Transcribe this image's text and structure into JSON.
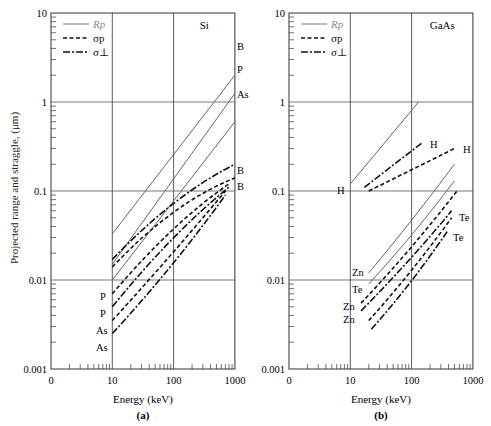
{
  "chart_data": [
    {
      "type": "line",
      "panel_label": "(a)",
      "material": "Si",
      "xlabel": "Energy (keV)",
      "ylabel": "Projected range and straggle, (μm)",
      "xscale": "log",
      "yscale": "log",
      "xticks": [
        "0",
        "10",
        "100",
        "1000"
      ],
      "yticks": [
        "10",
        "1",
        "0.1",
        "0.01",
        "0.001"
      ],
      "xlim": [
        1,
        1000
      ],
      "ylim": [
        0.001,
        10
      ],
      "grid": true,
      "legend": [
        {
          "label": "Rp",
          "style": "solid"
        },
        {
          "label": "σp",
          "style": "dashed"
        },
        {
          "label": "σ⊥",
          "style": "dashdot"
        }
      ],
      "legend_position": "upper left",
      "series": [
        {
          "name": "Rp B",
          "style": "solid",
          "label": "B",
          "x": [
            10,
            1000
          ],
          "y": [
            0.033,
            2.0
          ]
        },
        {
          "name": "Rp P",
          "style": "solid",
          "label": "P",
          "x": [
            10,
            1000
          ],
          "y": [
            0.015,
            1.25
          ]
        },
        {
          "name": "Rp As",
          "style": "solid",
          "label": "As",
          "x": [
            10,
            1000
          ],
          "y": [
            0.01,
            0.6
          ]
        },
        {
          "name": "σ⊥ B",
          "style": "dashdot",
          "label": "B",
          "x": [
            10,
            100,
            1000
          ],
          "y": [
            0.017,
            0.09,
            0.2
          ]
        },
        {
          "name": "σp B",
          "style": "dashed",
          "label": "B",
          "x": [
            10,
            100,
            1000
          ],
          "y": [
            0.014,
            0.075,
            0.14
          ]
        },
        {
          "name": "σp P",
          "style": "dashed",
          "label": "P",
          "x": [
            10,
            100,
            800
          ],
          "y": [
            0.007,
            0.045,
            0.12
          ]
        },
        {
          "name": "σ⊥ P",
          "style": "dashdot",
          "label": "P",
          "x": [
            10,
            100,
            800
          ],
          "y": [
            0.005,
            0.035,
            0.11
          ]
        },
        {
          "name": "σp As",
          "style": "dashed",
          "label": "As",
          "x": [
            10,
            100,
            700
          ],
          "y": [
            0.0035,
            0.02,
            0.1
          ]
        },
        {
          "name": "σ⊥ As",
          "style": "dashdot",
          "label": "As",
          "x": [
            10,
            100,
            700
          ],
          "y": [
            0.0025,
            0.014,
            0.09
          ]
        }
      ]
    },
    {
      "type": "line",
      "panel_label": "(b)",
      "material": "GaAs",
      "xlabel": "Energy (keV)",
      "ylabel": "",
      "xscale": "log",
      "yscale": "log",
      "xticks": [
        "0",
        "10",
        "100",
        "1000"
      ],
      "yticks": [
        "10",
        "1",
        "0.1",
        "0.01",
        "0.001"
      ],
      "xlim": [
        1,
        1000
      ],
      "ylim": [
        0.001,
        10
      ],
      "grid": true,
      "legend": [
        {
          "label": "Rp",
          "style": "solid"
        },
        {
          "label": "σp",
          "style": "dashed"
        },
        {
          "label": "σ⊥",
          "style": "dashdot"
        }
      ],
      "legend_position": "upper left",
      "series": [
        {
          "name": "Rp H",
          "style": "solid",
          "label": "H",
          "x": [
            10,
            130
          ],
          "y": [
            0.12,
            1.0
          ]
        },
        {
          "name": "σ⊥ H",
          "style": "dashdot",
          "label": "H",
          "x": [
            17,
            150
          ],
          "y": [
            0.11,
            0.35
          ]
        },
        {
          "name": "σp H",
          "style": "dashed",
          "label": "H",
          "x": [
            20,
            500
          ],
          "y": [
            0.1,
            0.3
          ]
        },
        {
          "name": "Rp Zn",
          "style": "solid",
          "label": "Zn",
          "x": [
            20,
            100,
            500
          ],
          "y": [
            0.012,
            0.045,
            0.2
          ]
        },
        {
          "name": "Rp Te",
          "style": "solid",
          "label": "Te",
          "x": [
            20,
            100,
            500
          ],
          "y": [
            0.009,
            0.03,
            0.13
          ]
        },
        {
          "name": "σp Zn",
          "style": "dashed",
          "label": "Zn",
          "x": [
            15,
            100,
            550
          ],
          "y": [
            0.0055,
            0.022,
            0.1
          ]
        },
        {
          "name": "σ⊥ Zn",
          "style": "dashdot",
          "label": "Zn",
          "x": [
            15,
            100,
            450
          ],
          "y": [
            0.0045,
            0.017,
            0.06
          ]
        },
        {
          "name": "σp Te",
          "style": "dashed",
          "label": "Te",
          "x": [
            20,
            100,
            450
          ],
          "y": [
            0.0035,
            0.012,
            0.05
          ]
        },
        {
          "name": "σ⊥ Te",
          "style": "dashdot",
          "label": "Te",
          "x": [
            22,
            100,
            380
          ],
          "y": [
            0.0028,
            0.009,
            0.035
          ]
        }
      ]
    }
  ],
  "ui": {
    "ylabel": "Projected range and straggle, (μm)",
    "xlabel_a": "Energy (keV)",
    "xlabel_b": "Energy (keV)",
    "panel_a": "(a)",
    "panel_b": "(b)",
    "material_a": "Si",
    "material_b": "GaAs",
    "legend_rp": "Rp",
    "legend_sp": "σp",
    "legend_sperp": "σ⊥"
  }
}
